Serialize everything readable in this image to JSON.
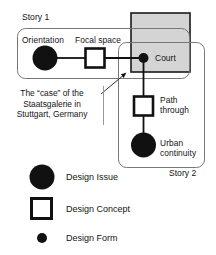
{
  "diagram": {
    "title_caption": "The “case” of the Staatsgalerie in Stuttgart, Germany",
    "caption_lines": [
      "The “case” of the",
      "Staatsgalerie in",
      "Stuttgart, Germany"
    ],
    "story1_label": "Story 1",
    "story2_label": "Story 2",
    "nodes": {
      "orientation": "Orientation",
      "focal_space": "Focal space",
      "court": "Court",
      "path_through": "Path through",
      "path_through_lines": [
        "Path",
        "through"
      ],
      "urban_continuity": "Urban continuity",
      "urban_continuity_lines": [
        "Urban",
        "continuity"
      ]
    },
    "highlight_color": "#d4d4d4",
    "ink_color": "#111111",
    "outline_color": "#6e6e6e"
  },
  "legend": {
    "items": [
      {
        "label": "Design Issue",
        "shape": "large-filled-circle"
      },
      {
        "label": "Design Concept",
        "shape": "open-square"
      },
      {
        "label": "Design Form",
        "shape": "small-filled-circle"
      }
    ]
  }
}
